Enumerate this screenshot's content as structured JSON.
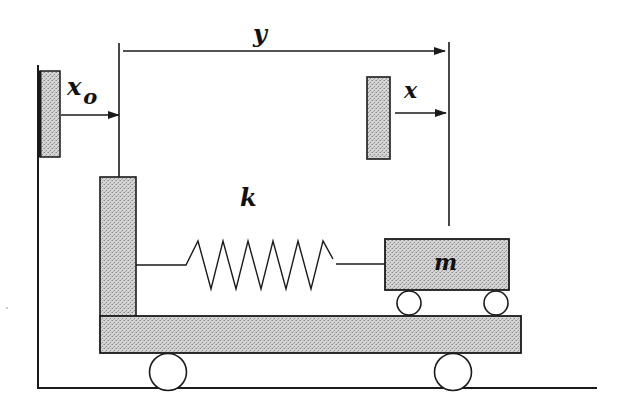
{
  "diagram": {
    "type": "mechanical-schematic",
    "labels": {
      "base_displacement": "x",
      "base_displacement_subscript": "o",
      "relative_displacement": "y",
      "mass_displacement": "x",
      "spring_constant": "k",
      "mass": "m"
    },
    "colors": {
      "stroke": "#1a1a1a",
      "fill_stipple": "#c8c8c8",
      "background": "#ffffff"
    },
    "components": [
      {
        "id": "ground",
        "kind": "line"
      },
      {
        "id": "left-wall",
        "kind": "line"
      },
      {
        "id": "base-reference-block",
        "kind": "rect"
      },
      {
        "id": "mass-reference-block",
        "kind": "rect"
      },
      {
        "id": "vertical-post",
        "kind": "rect"
      },
      {
        "id": "base-platform",
        "kind": "rect"
      },
      {
        "id": "spring",
        "kind": "zigzag"
      },
      {
        "id": "mass-block",
        "kind": "rect"
      },
      {
        "id": "platform-wheels",
        "count": 2
      },
      {
        "id": "mass-wheels",
        "count": 2
      }
    ]
  }
}
